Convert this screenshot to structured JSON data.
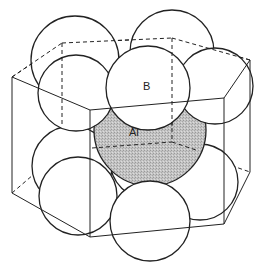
{
  "diagram": {
    "type": "crystal-structure",
    "colors": {
      "line": "#222222",
      "background": "#ffffff",
      "shaded_atom": "#b8b8b8"
    },
    "labels": {
      "boron": "B",
      "aluminium": "Al"
    },
    "atoms": [
      {
        "id": "top-back-left",
        "element": "B"
      },
      {
        "id": "top-back",
        "element": "B"
      },
      {
        "id": "top-right",
        "element": "B"
      },
      {
        "id": "top-front-left",
        "element": "B"
      },
      {
        "id": "top-front",
        "element": "B",
        "labeled": true
      },
      {
        "id": "center",
        "element": "Al",
        "labeled": true,
        "shaded": true
      },
      {
        "id": "bottom-back-left",
        "element": "B"
      },
      {
        "id": "bottom-front-left",
        "element": "B"
      },
      {
        "id": "bottom-front",
        "element": "B"
      },
      {
        "id": "bottom-right",
        "element": "B"
      },
      {
        "id": "bottom-back",
        "element": "B"
      }
    ]
  }
}
